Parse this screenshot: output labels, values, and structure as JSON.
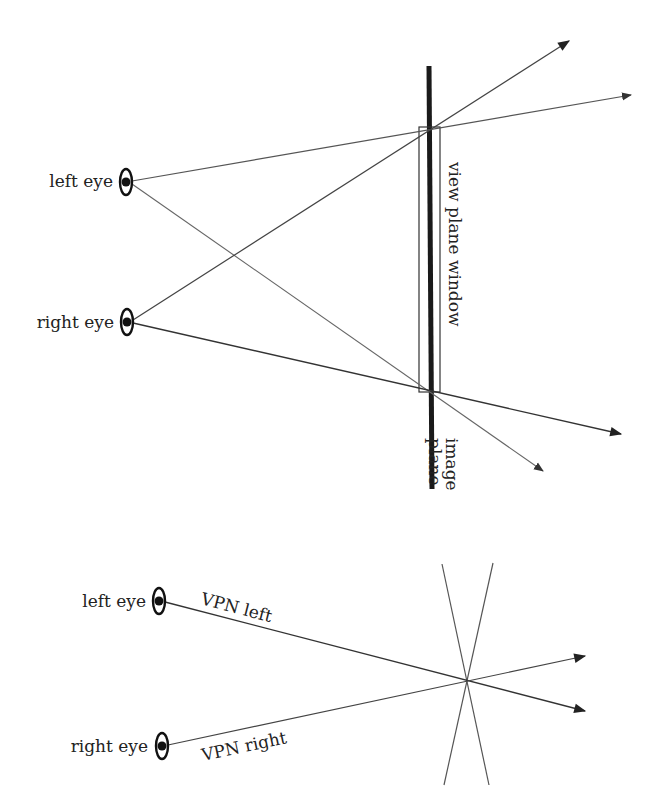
{
  "colors": {
    "line": "#444444",
    "dark": "#222222",
    "background": "#ffffff"
  },
  "top_diagram": {
    "left_eye_label": "left eye",
    "right_eye_label": "right eye",
    "window_label": "view plane window",
    "image_plane_label_line1": "image",
    "image_plane_label_line2": "plane",
    "icons": [
      "eye-icon",
      "eye-icon"
    ]
  },
  "bottom_diagram": {
    "left_eye_label": "left eye",
    "right_eye_label": "right eye",
    "vpn_left_label": "VPN left",
    "vpn_right_label": "VPN right",
    "icons": [
      "eye-icon",
      "eye-icon"
    ]
  }
}
